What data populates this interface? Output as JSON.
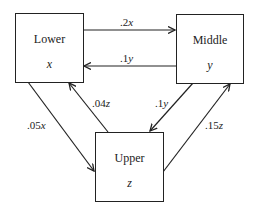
{
  "nodes": {
    "lower": {
      "title": "Lower",
      "var": "x"
    },
    "middle": {
      "title": "Middle",
      "var": "y"
    },
    "upper": {
      "title": "Upper",
      "var": "z"
    }
  },
  "edges": [
    {
      "from": "lower",
      "to": "middle",
      "coef": ".2",
      "var": "x"
    },
    {
      "from": "middle",
      "to": "lower",
      "coef": ".1",
      "var": "y"
    },
    {
      "from": "lower",
      "to": "upper",
      "coef": ".05",
      "var": "x"
    },
    {
      "from": "upper",
      "to": "lower",
      "coef": ".04",
      "var": "z"
    },
    {
      "from": "middle",
      "to": "upper",
      "coef": ".1",
      "var": "y"
    },
    {
      "from": "upper",
      "to": "middle",
      "coef": ".15",
      "var": "z"
    }
  ]
}
